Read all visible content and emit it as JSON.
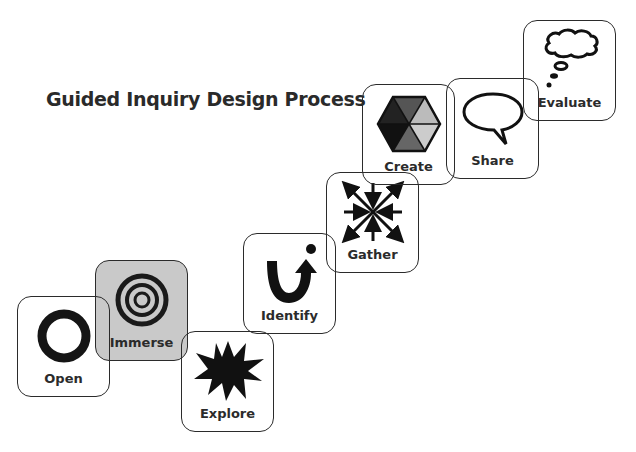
{
  "title": "Guided Inquiry Design Process",
  "colors": {
    "stroke": "#2b2b2b",
    "immerse_fill": "#c9c9c9",
    "background": "#ffffff"
  },
  "stages": [
    {
      "label": "Open",
      "icon": "ring-icon"
    },
    {
      "label": "Immerse",
      "icon": "concentric-circles-icon"
    },
    {
      "label": "Explore",
      "icon": "starburst-icon"
    },
    {
      "label": "Identify",
      "icon": "u-turn-arrow-icon"
    },
    {
      "label": "Gather",
      "icon": "converging-arrows-icon"
    },
    {
      "label": "Create",
      "icon": "hexagon-icon"
    },
    {
      "label": "Share",
      "icon": "speech-bubble-icon"
    },
    {
      "label": "Evaluate",
      "icon": "thought-bubble-icon"
    }
  ]
}
